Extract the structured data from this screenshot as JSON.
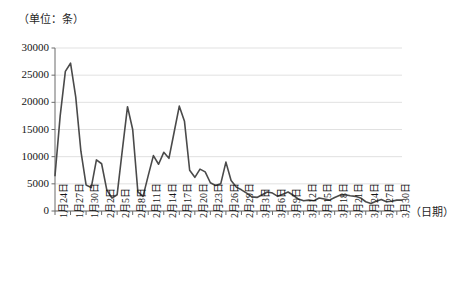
{
  "chart_data": {
    "type": "line",
    "title": "",
    "subtitle": "",
    "unit_label": "（单位：条）",
    "xlabel": "（日期）",
    "ylabel": "",
    "ylim": [
      0,
      30000
    ],
    "ytick_labels": [
      "0",
      "5000",
      "10000",
      "15000",
      "20000",
      "25000",
      "30000"
    ],
    "ytick_values": [
      0,
      5000,
      10000,
      15000,
      20000,
      25000,
      30000
    ],
    "grid": true,
    "legend": "none",
    "line_color": "#4a4a4a",
    "grid_color": "#d9d9d9",
    "axis_color": "#6b6b6b",
    "xtick_labels": [
      "1月24日",
      "1月27日",
      "1月30日",
      "2月2日",
      "2月5日",
      "2月8日",
      "2月11日",
      "2月14日",
      "2月17日",
      "2月20日",
      "2月23日",
      "2月26日",
      "2月29日",
      "3月3日",
      "3月6日",
      "3月9日",
      "3月12日",
      "3月15日",
      "3月18日",
      "3月21日",
      "3月24日",
      "3月27日",
      "3月30日"
    ],
    "xtick_indices": [
      0,
      3,
      6,
      9,
      12,
      15,
      18,
      21,
      24,
      27,
      30,
      33,
      36,
      39,
      42,
      45,
      48,
      51,
      54,
      57,
      60,
      63,
      66
    ],
    "x": [
      "1月24日",
      "1月25日",
      "1月26日",
      "1月27日",
      "1月28日",
      "1月29日",
      "1月30日",
      "1月31日",
      "2月1日",
      "2月2日",
      "2月3日",
      "2月4日",
      "2月5日",
      "2月6日",
      "2月7日",
      "2月8日",
      "2月9日",
      "2月10日",
      "2月11日",
      "2月12日",
      "2月13日",
      "2月14日",
      "2月15日",
      "2月16日",
      "2月17日",
      "2月18日",
      "2月19日",
      "2月20日",
      "2月21日",
      "2月22日",
      "2月23日",
      "2月24日",
      "2月25日",
      "2月26日",
      "2月27日",
      "2月28日",
      "2月29日",
      "3月1日",
      "3月2日",
      "3月3日",
      "3月4日",
      "3月5日",
      "3月6日",
      "3月7日",
      "3月8日",
      "3月9日",
      "3月10日",
      "3月11日",
      "3月12日",
      "3月13日",
      "3月14日",
      "3月15日",
      "3月16日",
      "3月17日",
      "3月18日",
      "3月19日",
      "3月20日",
      "3月21日",
      "3月22日",
      "3月23日",
      "3月24日",
      "3月25日",
      "3月26日",
      "3月27日",
      "3月28日",
      "3月29日",
      "3月30日",
      "3月31日"
    ],
    "values": [
      6500,
      17500,
      25700,
      27200,
      21000,
      11000,
      4800,
      4300,
      9400,
      8700,
      3900,
      2400,
      3000,
      11200,
      19200,
      15000,
      3500,
      2700,
      6500,
      10200,
      8600,
      10800,
      9700,
      14500,
      19300,
      16500,
      7500,
      6200,
      7700,
      7200,
      5200,
      4700,
      5000,
      9000,
      5600,
      4400,
      3900,
      3300,
      2600,
      2500,
      3000,
      3500,
      3300,
      2700,
      3100,
      3500,
      2900,
      2200,
      1900,
      2000,
      1900,
      2400,
      2200,
      2000,
      2500,
      2900,
      3000,
      2800,
      2700,
      2400,
      1700,
      1400,
      1800,
      2100,
      1700,
      1800,
      2000,
      2000
    ]
  },
  "plot": {
    "left": 55,
    "top": 48,
    "width": 347,
    "height": 163
  }
}
